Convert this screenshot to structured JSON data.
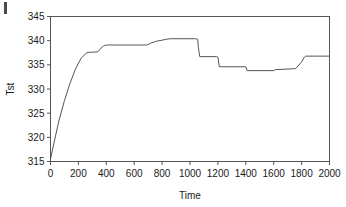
{
  "chart_data": {
    "type": "line",
    "title": "",
    "xlabel": "Time",
    "ylabel": "Tst",
    "xlim": [
      0,
      2000
    ],
    "ylim": [
      315,
      345
    ],
    "xticks": [
      0,
      200,
      400,
      600,
      800,
      1000,
      1200,
      1400,
      1600,
      1800,
      2000
    ],
    "yticks": [
      315,
      320,
      325,
      330,
      335,
      340,
      345
    ],
    "grid": false,
    "legend": null,
    "line_color": "#555555",
    "series": [
      {
        "name": "Tst",
        "x": [
          0,
          20,
          60,
          100,
          140,
          180,
          220,
          260,
          275,
          300,
          340,
          360,
          380,
          400,
          430,
          500,
          600,
          690,
          700,
          720,
          760,
          800,
          830,
          860,
          900,
          1000,
          1040,
          1055,
          1060,
          1070,
          1190,
          1200,
          1210,
          1400,
          1410,
          1600,
          1610,
          1750,
          1760,
          1800,
          1820,
          1830,
          1900,
          2000
        ],
        "y": [
          315.5,
          318.2,
          323.4,
          327.6,
          331.2,
          334.2,
          336.4,
          337.5,
          337.6,
          337.6,
          337.7,
          338.4,
          338.9,
          339.1,
          339.1,
          339.1,
          339.1,
          339.1,
          339.2,
          339.5,
          339.9,
          340.1,
          340.3,
          340.4,
          340.4,
          340.4,
          340.4,
          340.3,
          338.6,
          336.7,
          336.7,
          336.6,
          334.6,
          334.6,
          333.8,
          333.8,
          334.0,
          334.2,
          334.3,
          335.6,
          336.6,
          336.8,
          336.8,
          336.8
        ]
      }
    ]
  },
  "axes": {
    "x_title": "Time",
    "y_title": "Tst"
  },
  "marks": {
    "corner_artifact": "page-edge-mark"
  }
}
